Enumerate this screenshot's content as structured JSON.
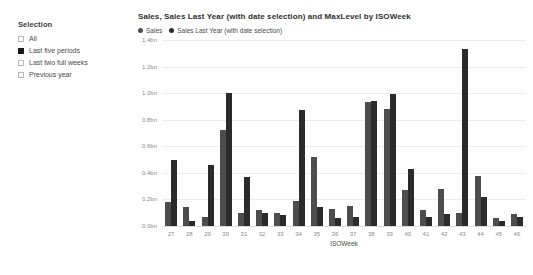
{
  "slicer": {
    "title": "Selection",
    "items": [
      {
        "label": "All",
        "checked": false
      },
      {
        "label": "Last five periods",
        "checked": true
      },
      {
        "label": "Last two full weeks",
        "checked": false
      },
      {
        "label": "Previous year",
        "checked": false
      }
    ]
  },
  "chart_data": {
    "type": "bar",
    "title": "Sales, Sales Last Year (with date selection) and MaxLevel by ISOWeek",
    "xlabel": "ISOWeek",
    "ylabel": "",
    "ylim": [
      0,
      1.4
    ],
    "grid": true,
    "legend_position": "top-left",
    "ytick_labels": [
      "1.4bn",
      "1.2bn",
      "1.0bn",
      "0.8bn",
      "0.6bn",
      "0.4bn",
      "0.2bn",
      "0.0bn"
    ],
    "ytick_values": [
      1.4,
      1.2,
      1.0,
      0.8,
      0.6,
      0.4,
      0.2,
      0.0
    ],
    "categories": [
      "27",
      "28",
      "29",
      "30",
      "31",
      "32",
      "33",
      "34",
      "35",
      "36",
      "37",
      "38",
      "39",
      "40",
      "41",
      "42",
      "43",
      "44",
      "45",
      "46"
    ],
    "series": [
      {
        "name": "Sales",
        "color": "#4d4d4d",
        "values": [
          0.18,
          0.14,
          0.07,
          0.72,
          0.1,
          0.12,
          0.1,
          0.19,
          0.52,
          0.13,
          0.15,
          0.93,
          0.88,
          0.27,
          0.12,
          0.28,
          0.1,
          0.38,
          0.06,
          0.09
        ]
      },
      {
        "name": "Sales Last Year (with date selection)",
        "color": "#2b2b2b",
        "values": [
          0.5,
          0.04,
          0.46,
          1.0,
          0.37,
          0.1,
          0.08,
          0.87,
          0.14,
          0.06,
          0.07,
          0.94,
          0.99,
          0.43,
          0.07,
          0.09,
          1.33,
          0.22,
          0.04,
          0.07
        ]
      }
    ]
  }
}
